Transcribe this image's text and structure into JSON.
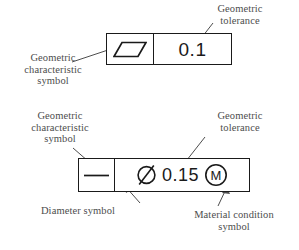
{
  "diagram": {
    "ink_color": "#1a1a1a",
    "label_color": "#4d4d4d",
    "background": "#ffffff"
  },
  "frames": [
    {
      "id": "upper-frame",
      "characteristic": "parallelism",
      "characteristic_icon": "parallelogram-icon",
      "tolerance_value": "0.1",
      "has_diameter_symbol": false,
      "material_condition": null
    },
    {
      "id": "lower-frame",
      "characteristic": "straightness",
      "characteristic_icon": "straightness-line-icon",
      "diameter_symbol": "Ø",
      "tolerance_value": "0.15",
      "has_diameter_symbol": true,
      "material_condition": "M"
    }
  ],
  "labels": {
    "upper_tolerance": "Geometric\ntolerance",
    "upper_characteristic": "Geometric\ncharacteristic\nsymbol",
    "lower_characteristic": "Geometric\ncharacteristic\nsymbol",
    "lower_tolerance": "Geometric\ntolerance",
    "diameter": "Diameter symbol",
    "material_condition": "Material condition\nsymbol"
  }
}
